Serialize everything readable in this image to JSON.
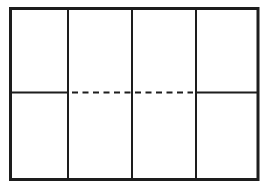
{
  "figure": {
    "background_color": "#ffffff",
    "line_color": "#1d1d1d",
    "canvas": {
      "width": 263,
      "height": 189
    },
    "columns": 4,
    "elements": {
      "outer_rect": {
        "x": 10.5,
        "y": 8.5,
        "width": 247.5,
        "height": 171,
        "fill": "none",
        "stroke": "#1d1d1d",
        "stroke-width": 3
      },
      "divider_1": {
        "x1": 68,
        "y1": 10,
        "x2": 68,
        "y2": 178.5,
        "stroke": "#1d1d1d",
        "stroke-width": 2
      },
      "divider_2": {
        "x1": 132,
        "y1": 10,
        "x2": 132,
        "y2": 178.5,
        "stroke": "#1d1d1d",
        "stroke-width": 2
      },
      "divider_3": {
        "x1": 196,
        "y1": 10,
        "x2": 196,
        "y2": 178.5,
        "stroke": "#1d1d1d",
        "stroke-width": 2
      },
      "midline_left_solid": {
        "x1": 10,
        "y1": 92.5,
        "x2": 68,
        "y2": 92.5,
        "stroke": "#1d1d1d",
        "stroke-width": 2
      },
      "midline_center_dashed": {
        "x1": 72,
        "y1": 92.5,
        "x2": 193,
        "y2": 92.5,
        "stroke": "#1d1d1d",
        "stroke-width": 2,
        "stroke-dasharray": "6 4.5"
      },
      "midline_right_solid": {
        "x1": 196,
        "y1": 92.5,
        "x2": 258,
        "y2": 92.5,
        "stroke": "#1d1d1d",
        "stroke-width": 2
      }
    }
  }
}
